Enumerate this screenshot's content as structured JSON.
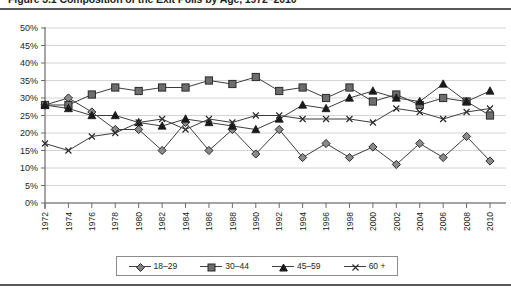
{
  "figure": {
    "title": "Figure 3.1   Composition of the Exit Polls by Age, 1972–2010"
  },
  "legend": {
    "position": "bottom",
    "items": [
      {
        "label": "18–29",
        "marker": "diamond-marker-icon",
        "color": "#808080"
      },
      {
        "label": "30–44",
        "marker": "square-marker-icon",
        "color": "#6d6d6d"
      },
      {
        "label": "45–59",
        "marker": "triangle-marker-icon",
        "color": "#1a1a1a"
      },
      {
        "label": "60 +",
        "marker": "x-marker-icon",
        "color": "#404040"
      }
    ]
  },
  "axes": {
    "y_ticks": [
      "0%",
      "5%",
      "10%",
      "15%",
      "20%",
      "25%",
      "30%",
      "35%",
      "40%",
      "45%",
      "50%"
    ],
    "x_ticks": [
      "1972",
      "1974",
      "1976",
      "1978",
      "1980",
      "1982",
      "1984",
      "1986",
      "1988",
      "1990",
      "1992",
      "1994",
      "1996",
      "1998",
      "2000",
      "2002",
      "2004",
      "2006",
      "2008",
      "2010"
    ]
  },
  "chart_data": {
    "type": "line",
    "title": "Figure 3.1   Composition of the Exit Polls by Age, 1972–2010",
    "xlabel": "",
    "ylabel": "",
    "ylim": [
      0,
      50
    ],
    "ytick_step": 5,
    "ytick_suffix": "%",
    "grid": "horizontal",
    "legend_position": "bottom",
    "categories": [
      1972,
      1974,
      1976,
      1978,
      1980,
      1982,
      1984,
      1986,
      1988,
      1990,
      1992,
      1994,
      1996,
      1998,
      2000,
      2002,
      2004,
      2006,
      2008,
      2010
    ],
    "series": [
      {
        "name": "18–29",
        "marker": "diamond",
        "values": [
          28,
          30,
          26,
          21,
          21,
          15,
          23,
          15,
          21,
          14,
          21,
          13,
          17,
          13,
          16,
          11,
          17,
          13,
          19,
          12
        ]
      },
      {
        "name": "30–44",
        "marker": "square",
        "values": [
          28,
          28,
          31,
          33,
          32,
          33,
          33,
          35,
          34,
          36,
          32,
          33,
          30,
          33,
          29,
          31,
          28,
          30,
          29,
          25
        ]
      },
      {
        "name": "45–59",
        "marker": "triangle",
        "values": [
          28,
          27,
          25,
          25,
          23,
          22,
          24,
          23,
          22,
          21,
          24,
          28,
          27,
          30,
          32,
          30,
          29,
          34,
          29,
          32
        ]
      },
      {
        "name": "60 +",
        "marker": "x",
        "values": [
          17,
          15,
          19,
          20,
          23,
          24,
          21,
          24,
          23,
          25,
          25,
          24,
          24,
          24,
          23,
          27,
          26,
          24,
          26,
          27
        ]
      }
    ]
  }
}
